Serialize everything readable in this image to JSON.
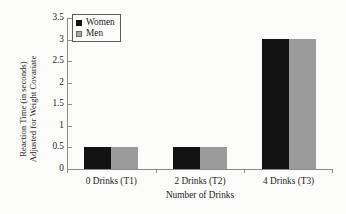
{
  "chart_data": {
    "type": "bar",
    "title": "",
    "subtitle": "",
    "xlabel": "Number of Drinks",
    "ylabel": "Reaction Time (in seconds) Adjusted for Weight Covariate",
    "ylabel_lines": [
      "Reaction Time (in seconds)",
      "Adjusted for Weight Covariate"
    ],
    "categories": [
      "0 Drinks (T1)",
      "2 Drinks (T2)",
      "4 Drinks (T3)"
    ],
    "series": [
      {
        "name": "Women",
        "values": [
          0.5,
          0.51,
          3.01
        ],
        "color": "#121212"
      },
      {
        "name": "Men",
        "values": [
          0.5,
          0.51,
          3.01
        ],
        "color": "#9b9b9b"
      }
    ],
    "ylim": [
      0,
      3.5
    ],
    "yticks": [
      0,
      0.5,
      1,
      1.5,
      2,
      2.5,
      3,
      3.5
    ],
    "ytick_labels": [
      "0",
      "0.5",
      "1",
      "1.5",
      "2",
      "2.5",
      "3",
      "3.5"
    ],
    "grid": false,
    "legend_position": "upper left",
    "legend_entries": [
      "Women",
      "Men"
    ],
    "bar_group_gap": true,
    "annotations": []
  },
  "axes": {
    "axis_color": "#8c8c8c",
    "text_color": "#1c1c1c"
  },
  "figure": {
    "background": "#fcfcfb"
  }
}
